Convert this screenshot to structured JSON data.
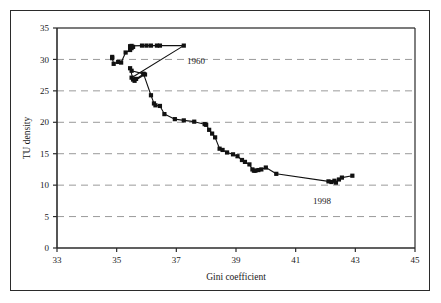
{
  "figure": {
    "background_color": "#ffffff",
    "frame_color": "#2b2b2b",
    "axis_color": "#2b2b2b",
    "grid_color": "#9a9a9a",
    "series_color": "#111111"
  },
  "axes": {
    "x_title": "Gini coefficient",
    "y_title": "TU density",
    "x_ticks": [
      "33",
      "35",
      "37",
      "39",
      "41",
      "43",
      "45"
    ],
    "y_ticks": [
      "0",
      "5",
      "10",
      "15",
      "20",
      "25",
      "30",
      "35"
    ]
  },
  "annotations": {
    "start_label": "1960",
    "end_label": "1998"
  },
  "chart_data": {
    "type": "line",
    "title": "",
    "xlabel": "Gini coefficient",
    "ylabel": "TU density",
    "xlim": [
      33,
      45
    ],
    "ylim": [
      0,
      35
    ],
    "x_ticks": [
      33,
      35,
      37,
      39,
      41,
      43,
      45
    ],
    "y_ticks": [
      0,
      5,
      10,
      15,
      20,
      25,
      30,
      35
    ],
    "grid": "horizontal-dashed",
    "legend": "none",
    "markers": "filled-square",
    "annotations": [
      {
        "text": "1960",
        "x": 37.0,
        "y": 30.1
      },
      {
        "text": "1998",
        "x": 41.0,
        "y": 8.5
      }
    ],
    "series": [
      {
        "name": "Gini coefficient vs TU density (1960-1998)",
        "x": [
          34.85,
          34.85,
          34.9,
          35.05,
          35.15,
          35.3,
          35.45,
          35.5,
          35.55,
          35.45,
          35.5,
          35.85,
          36.0,
          36.15,
          36.35,
          36.45,
          37.25,
          35.5,
          35.55,
          35.45,
          35.5,
          35.9,
          35.95,
          35.6,
          35.65,
          35.9,
          36.15,
          36.25,
          36.3,
          36.45,
          36.6,
          36.95,
          37.25,
          37.6,
          37.95,
          38.0,
          38.1,
          38.2,
          38.3,
          38.45,
          38.55,
          38.7,
          38.9,
          39.05,
          39.2,
          39.3,
          39.45,
          39.55,
          39.6,
          39.65,
          39.75,
          39.85,
          40.0,
          40.35,
          42.1,
          42.2,
          42.3,
          42.35,
          42.45,
          42.55,
          42.9
        ],
        "y": [
          30.4,
          30.2,
          29.3,
          29.6,
          29.5,
          31.1,
          31.5,
          31.8,
          32.0,
          32.1,
          32.15,
          32.2,
          32.2,
          32.2,
          32.2,
          32.2,
          32.2,
          27.1,
          26.8,
          28.6,
          28.2,
          27.7,
          27.6,
          26.6,
          26.9,
          27.7,
          24.3,
          23.0,
          22.7,
          22.6,
          21.3,
          20.5,
          20.3,
          20.1,
          19.7,
          19.6,
          18.8,
          18.2,
          17.6,
          15.8,
          15.6,
          15.2,
          14.9,
          14.6,
          14.0,
          13.7,
          13.3,
          12.5,
          12.3,
          12.3,
          12.4,
          12.5,
          12.8,
          11.8,
          10.6,
          10.5,
          10.7,
          10.4,
          10.9,
          11.2,
          11.5
        ]
      }
    ]
  }
}
